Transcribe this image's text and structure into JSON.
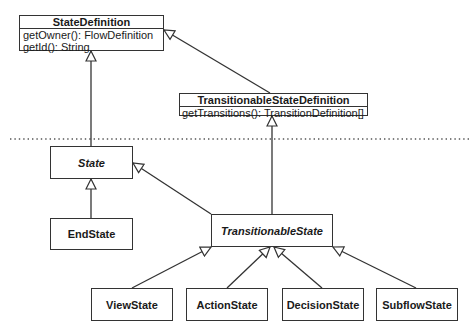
{
  "diagram": {
    "type": "uml-class-diagram",
    "separator": "dotted-horizontal-line",
    "classes": [
      {
        "id": "StateDefinition",
        "name": "StateDefinition",
        "kind": "interface",
        "operations": [
          "getOwner(): FlowDefinition",
          "getId(): String"
        ]
      },
      {
        "id": "TransitionableStateDefinition",
        "name": "TransitionableStateDefinition",
        "kind": "interface",
        "operations": [
          "getTransitions(): TransitionDefinition[]"
        ]
      },
      {
        "id": "State",
        "name": "State",
        "kind": "abstract"
      },
      {
        "id": "EndState",
        "name": "EndState",
        "kind": "class"
      },
      {
        "id": "TransitionableState",
        "name": "TransitionableState",
        "kind": "abstract"
      },
      {
        "id": "ViewState",
        "name": "ViewState",
        "kind": "class"
      },
      {
        "id": "ActionState",
        "name": "ActionState",
        "kind": "class"
      },
      {
        "id": "DecisionState",
        "name": "DecisionState",
        "kind": "class"
      },
      {
        "id": "SubflowState",
        "name": "SubflowState",
        "kind": "class"
      }
    ],
    "relations": [
      {
        "from": "TransitionableStateDefinition",
        "to": "StateDefinition",
        "type": "generalization"
      },
      {
        "from": "State",
        "to": "StateDefinition",
        "type": "generalization"
      },
      {
        "from": "TransitionableState",
        "to": "TransitionableStateDefinition",
        "type": "generalization"
      },
      {
        "from": "EndState",
        "to": "State",
        "type": "generalization"
      },
      {
        "from": "TransitionableState",
        "to": "State",
        "type": "generalization"
      },
      {
        "from": "ViewState",
        "to": "TransitionableState",
        "type": "generalization"
      },
      {
        "from": "ActionState",
        "to": "TransitionableState",
        "type": "generalization"
      },
      {
        "from": "DecisionState",
        "to": "TransitionableState",
        "type": "generalization"
      },
      {
        "from": "SubflowState",
        "to": "TransitionableState",
        "type": "generalization"
      }
    ]
  },
  "labels": {
    "state_definition": {
      "name": "StateDefinition",
      "op1": "getOwner(): FlowDefinition",
      "op2": "getId(): String"
    },
    "transitionable_state_definition": {
      "name": "TransitionableStateDefinition",
      "op1": "getTransitions(): TransitionDefinition[]"
    },
    "state": "State",
    "end_state": "EndState",
    "transitionable_state": "TransitionableState",
    "view_state": "ViewState",
    "action_state": "ActionState",
    "decision_state": "DecisionState",
    "subflow_state": "SubflowState"
  },
  "colors": {
    "line": "#333333",
    "background": "#ffffff",
    "separator": "#555555"
  }
}
